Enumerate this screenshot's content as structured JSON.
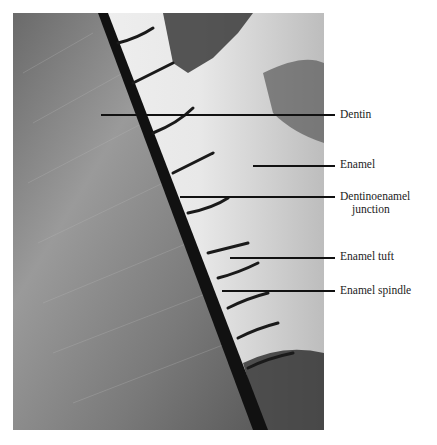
{
  "figure": {
    "labels": [
      {
        "id": "dentin",
        "text": "Dentin",
        "line_y": 114,
        "line_x0": 101,
        "label_x": 340,
        "label_y": 108
      },
      {
        "id": "enamel",
        "text": "Enamel",
        "line_y": 165,
        "line_x0": 253,
        "label_x": 340,
        "label_y": 158
      },
      {
        "id": "dej",
        "text": "Dentinoenamel",
        "text2": "junction",
        "line_y": 196,
        "line_x0": 180,
        "label_x": 340,
        "label_y": 190
      },
      {
        "id": "tuft",
        "text": "Enamel tuft",
        "line_y": 257,
        "line_x0": 230,
        "label_x": 340,
        "label_y": 250
      },
      {
        "id": "spindle",
        "text": "Enamel spindle",
        "line_y": 290,
        "line_x0": 222,
        "label_x": 340,
        "label_y": 284
      }
    ]
  }
}
